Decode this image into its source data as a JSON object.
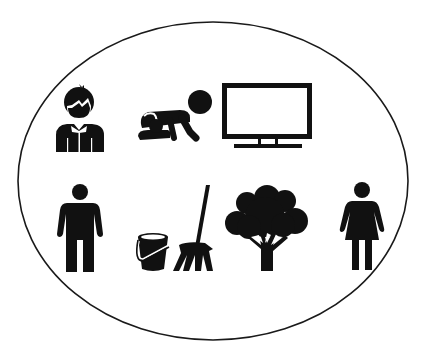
{
  "diagram": {
    "title": "",
    "container": {
      "shape": "ellipse",
      "stroke": "#1a1a1a",
      "fill": "#ffffff"
    },
    "icon_color": "#111111",
    "rows": [
      {
        "items": [
          {
            "id": "boy",
            "icon": "boy-icon",
            "label": ""
          },
          {
            "id": "crawling-baby",
            "icon": "crawling-baby-icon",
            "label": ""
          },
          {
            "id": "television",
            "icon": "television-icon",
            "label": ""
          }
        ]
      },
      {
        "items": [
          {
            "id": "man",
            "icon": "man-icon",
            "label": ""
          },
          {
            "id": "bucket-and-mop",
            "icon": "bucket-mop-icon",
            "label": ""
          },
          {
            "id": "tree",
            "icon": "tree-icon",
            "label": ""
          },
          {
            "id": "woman",
            "icon": "woman-icon",
            "label": ""
          }
        ]
      }
    ]
  }
}
